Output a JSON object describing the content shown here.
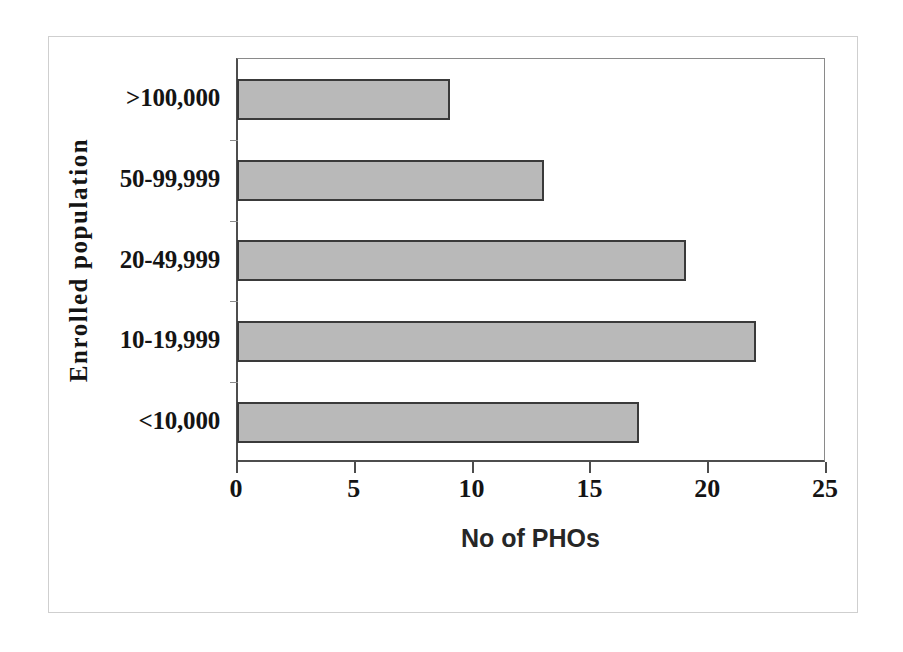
{
  "chart_data": {
    "type": "bar",
    "orientation": "horizontal",
    "title": "",
    "subtitle": "",
    "xlabel": "No of PHOs",
    "ylabel": "Enrolled population",
    "categories": [
      ">100,000",
      "50-99,999",
      "20-49,999",
      "10-19,999",
      "<10,000"
    ],
    "values": [
      9,
      13,
      19,
      22,
      17
    ],
    "xlim": [
      0,
      25
    ],
    "xticks": [
      0,
      5,
      10,
      15,
      20,
      25
    ],
    "xtick_labels": [
      "0",
      "5",
      "10",
      "15",
      "20",
      "25"
    ],
    "grid": false,
    "legend": null,
    "legend_position": "none",
    "annotations": [],
    "bar_fill_color": "#b9b9b9",
    "bar_edge_color": "#3a3a3a",
    "axis_color": "#4d4d4d",
    "text_color": "#141414",
    "background_color": "#ffffff",
    "frame_border_color": "#cfcfcf"
  }
}
